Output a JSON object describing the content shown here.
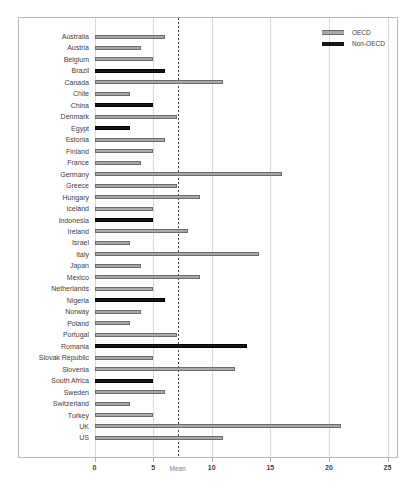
{
  "legend": {
    "items": [
      {
        "label": "OECD",
        "key": "oecd",
        "color": "#a6a6a6"
      },
      {
        "label": "Non-OECD",
        "key": "non_oecd",
        "color": "#161616"
      }
    ]
  },
  "colors": {
    "oecd_bar_fill": "#a6a6a6",
    "oecd_bar_border": "#6d6d6d",
    "non_oecd_bar": "#161616",
    "gridline": "#d9d9d9",
    "mean_line": "#3f3f3f",
    "frame_border": "#b8b8b8",
    "label_text": "#3d3d3d"
  },
  "chart_data": {
    "type": "bar",
    "orientation": "horizontal",
    "title": "",
    "xlabel": "",
    "ylabel": "",
    "xlim": [
      0,
      25
    ],
    "x_ticks": [
      0,
      5,
      10,
      15,
      20,
      25
    ],
    "grid": true,
    "legend_position": "top-right",
    "mean_line": {
      "label": "Mean",
      "value": 7.1
    },
    "categories": [
      "Australia",
      "Austria",
      "Belgium",
      "Brazil",
      "Canada",
      "Chile",
      "China",
      "Denmark",
      "Egypt",
      "Estonia",
      "Finland",
      "France",
      "Germany",
      "Greece",
      "Hungary",
      "Iceland",
      "Indonesia",
      "Ireland",
      "Israel",
      "Italy",
      "Japan",
      "Mexico",
      "Netherlands",
      "Nigeria",
      "Norway",
      "Poland",
      "Portugal",
      "Romania",
      "Slovak Republic",
      "Slovenia",
      "South Africa",
      "Sweden",
      "Switzerland",
      "Turkey",
      "UK",
      "US"
    ],
    "values": [
      6,
      4,
      5,
      6,
      11,
      3,
      5,
      7,
      3,
      6,
      5,
      4,
      16,
      7,
      9,
      5,
      5,
      8,
      3,
      14,
      4,
      9,
      5,
      6,
      4,
      3,
      7,
      13,
      5,
      12,
      5,
      6,
      3,
      5,
      21,
      11
    ],
    "groups": [
      "OECD",
      "OECD",
      "OECD",
      "Non-OECD",
      "OECD",
      "OECD",
      "Non-OECD",
      "OECD",
      "Non-OECD",
      "OECD",
      "OECD",
      "OECD",
      "OECD",
      "OECD",
      "OECD",
      "OECD",
      "Non-OECD",
      "OECD",
      "OECD",
      "OECD",
      "OECD",
      "OECD",
      "OECD",
      "Non-OECD",
      "OECD",
      "OECD",
      "OECD",
      "Non-OECD",
      "OECD",
      "OECD",
      "Non-OECD",
      "OECD",
      "OECD",
      "OECD",
      "OECD",
      "OECD"
    ]
  }
}
